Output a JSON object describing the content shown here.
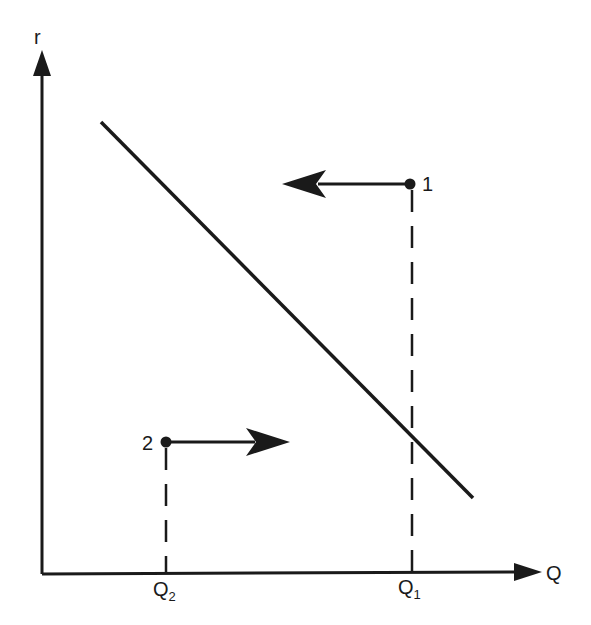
{
  "diagram": {
    "axes": {
      "y_label": "r",
      "x_label": "Q"
    },
    "points": [
      {
        "label": "1",
        "arrow_direction": "left"
      },
      {
        "label": "2",
        "arrow_direction": "right"
      }
    ],
    "x_ticks": [
      {
        "base": "Q",
        "sub": "2"
      },
      {
        "base": "Q",
        "sub": "1"
      }
    ],
    "line": "downward-sloping curve",
    "colors": {
      "ink": "#1a1a1a",
      "background": "#ffffff"
    }
  }
}
